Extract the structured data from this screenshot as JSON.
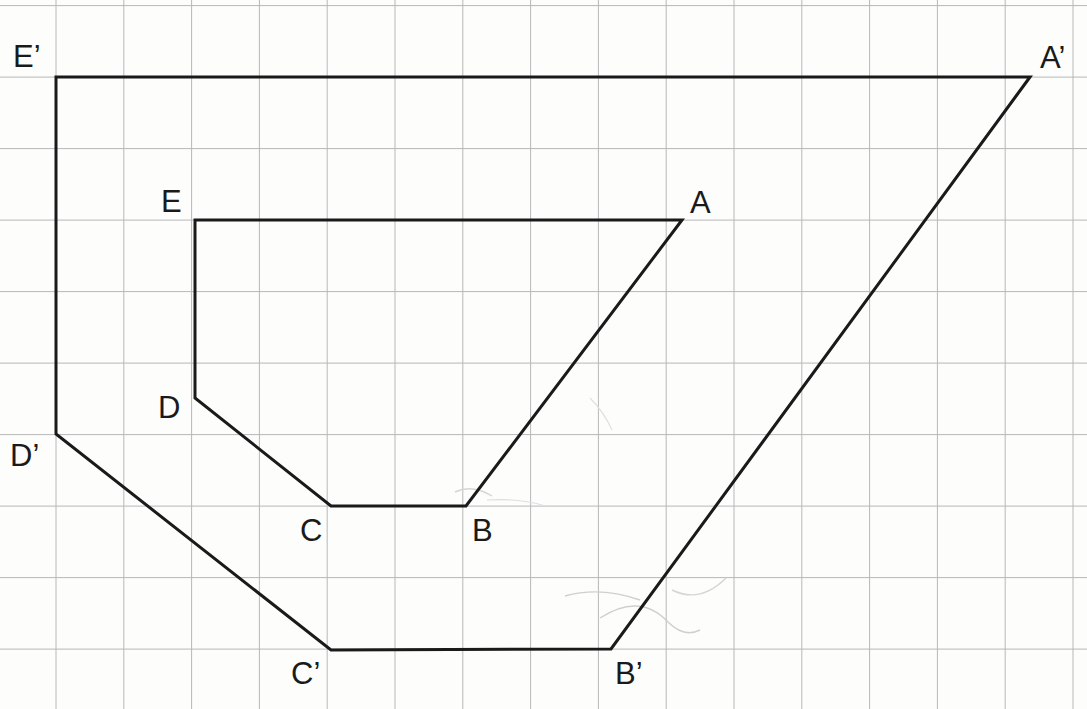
{
  "figure": {
    "background_color": "#fdfdfc",
    "grid_color": "#b8b8b8",
    "stroke_color": "#1a1a1a",
    "width": 1087,
    "height": 709
  },
  "grid": {
    "x_start": 56,
    "x_step": 67.8,
    "x_count": 16,
    "y_start": 5.6,
    "y_step": 71.5,
    "y_count": 11,
    "line_width": 1
  },
  "labels": {
    "A": "A",
    "B": "B",
    "C": "C",
    "D": "D",
    "E": "E",
    "A_prime": "A’",
    "B_prime": "B’",
    "C_prime": "C’",
    "D_prime": "D’",
    "E_prime": "E’"
  },
  "chart_data": {
    "type": "scatter",
    "xlabel": "",
    "ylabel": "",
    "grid": true,
    "legend_position": "none",
    "xlim": [
      0,
      1087
    ],
    "ylim": [
      709,
      0
    ],
    "series": [
      {
        "name": "Inner polygon ABCDE",
        "closed": true,
        "stroke_width": 3,
        "points": [
          {
            "label": "A",
            "x": 682,
            "y": 220
          },
          {
            "label": "B",
            "x": 466,
            "y": 506
          },
          {
            "label": "C",
            "x": 331,
            "y": 506
          },
          {
            "label": "D",
            "x": 195,
            "y": 398
          },
          {
            "label": "E",
            "x": 195,
            "y": 220
          }
        ]
      },
      {
        "name": "Outer polygon A'B'C'D'E'",
        "closed": true,
        "stroke_width": 3,
        "points": [
          {
            "label": "A’",
            "x": 1030,
            "y": 77
          },
          {
            "label": "B’",
            "x": 611,
            "y": 649
          },
          {
            "label": "C’",
            "x": 331,
            "y": 650
          },
          {
            "label": "D’",
            "x": 56,
            "y": 434
          },
          {
            "label": "E’",
            "x": 56,
            "y": 77
          }
        ]
      }
    ],
    "label_offsets": [
      {
        "label": "A",
        "x": 690,
        "y": 191,
        "anchor": "start"
      },
      {
        "label": "B",
        "x": 472,
        "y": 519,
        "anchor": "start"
      },
      {
        "label": "C",
        "x": 300,
        "y": 519,
        "anchor": "start"
      },
      {
        "label": "D",
        "x": 158,
        "y": 396,
        "anchor": "start"
      },
      {
        "label": "E",
        "x": 161,
        "y": 190,
        "anchor": "start"
      },
      {
        "label": "A’",
        "x": 1040,
        "y": 46,
        "anchor": "start"
      },
      {
        "label": "B’",
        "x": 615,
        "y": 662,
        "anchor": "start"
      },
      {
        "label": "C’",
        "x": 291,
        "y": 662,
        "anchor": "start"
      },
      {
        "label": "D’",
        "x": 10,
        "y": 444,
        "anchor": "start"
      },
      {
        "label": "E’",
        "x": 13,
        "y": 45,
        "anchor": "start"
      }
    ]
  }
}
